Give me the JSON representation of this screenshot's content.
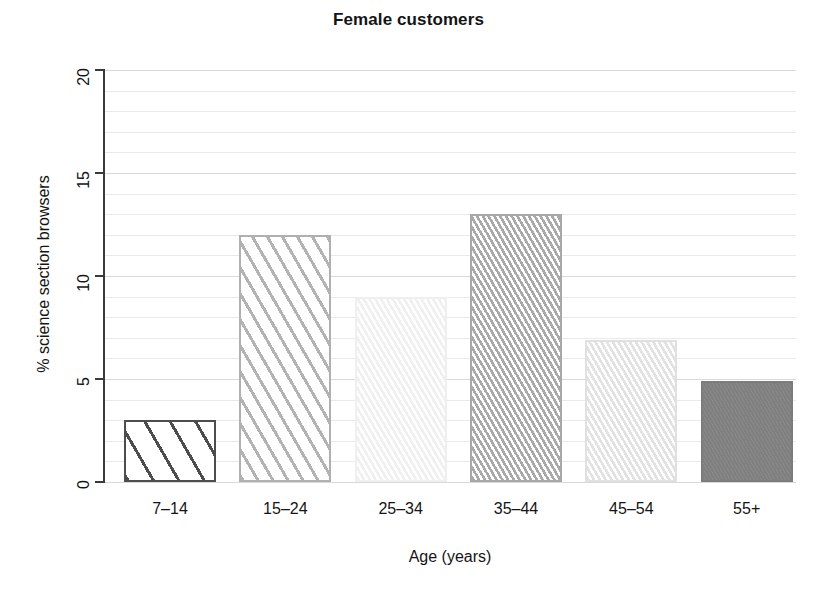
{
  "chart_data": {
    "type": "bar",
    "title": "Female customers",
    "xlabel": "Age (years)",
    "ylabel": "% science section browsers",
    "categories": [
      "7–14",
      "15–24",
      "25–34",
      "35–44",
      "45–54",
      "55+"
    ],
    "values": [
      3.0,
      12.0,
      9.0,
      13.0,
      6.9,
      4.9
    ],
    "series": [
      {
        "name": "% science section browsers",
        "values": [
          3.0,
          12.0,
          9.0,
          13.0,
          6.9,
          4.9
        ]
      }
    ],
    "ylim": [
      0,
      20
    ],
    "xlim": [
      0,
      6
    ],
    "yticks": [
      0,
      5,
      10,
      15,
      20
    ],
    "ytick_labels": [
      "0",
      "5",
      "10",
      "15",
      "20"
    ],
    "grid": true,
    "grid_minor_step": 1,
    "legend": "none",
    "bar_styles": [
      {
        "category": "7–14",
        "edge_color": "#4d4d4d",
        "hatch": "diagonal-wide",
        "hatch_color": "#4d4d4d",
        "fill_color": "#ffffff"
      },
      {
        "category": "15–24",
        "edge_color": "#b0b0b0",
        "hatch": "diagonal-medium",
        "hatch_color": "#b3b3b3",
        "fill_color": "#ffffff"
      },
      {
        "category": "25–34",
        "edge_color": "#efefef",
        "hatch": "diagonal-dense",
        "hatch_color": "#f0f0f0",
        "fill_color": "#ffffff"
      },
      {
        "category": "35–44",
        "edge_color": "#a8a8a8",
        "hatch": "diagonal-dense",
        "hatch_color": "#a9a9a9",
        "fill_color": "#ffffff"
      },
      {
        "category": "45–54",
        "edge_color": "#e0e0e0",
        "hatch": "diagonal-dense",
        "hatch_color": "#e2e2e2",
        "fill_color": "#ffffff"
      },
      {
        "category": "55+",
        "edge_color": "#7c7c7c",
        "hatch": "diagonal-verydense",
        "hatch_color": "#808080",
        "fill_color": "#8a8a8a"
      }
    ],
    "colors": {
      "background": "#ffffff",
      "axis": "#3a3a3a",
      "grid_minor": "#e9e9ec",
      "grid_major": "#d8d8dd",
      "text": "#141414"
    }
  }
}
